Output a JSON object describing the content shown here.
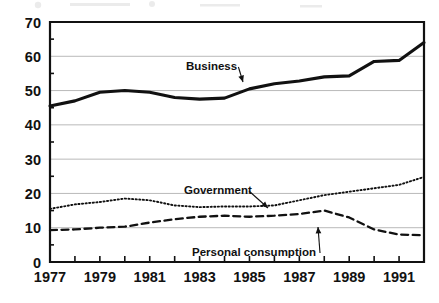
{
  "chart_data": {
    "type": "line",
    "title": "",
    "subtitle": "",
    "xlabel": "",
    "ylabel": "",
    "xlim": [
      1977,
      1992
    ],
    "ylim": [
      0,
      70
    ],
    "yticks": [
      0,
      10,
      20,
      30,
      40,
      50,
      60,
      70
    ],
    "ytick_labels": [
      "0",
      "10",
      "20",
      "30",
      "40",
      "50",
      "60",
      "70"
    ],
    "x": [
      1977,
      1978,
      1979,
      1980,
      1981,
      1982,
      1983,
      1984,
      1985,
      1986,
      1987,
      1988,
      1989,
      1990,
      1991,
      1992
    ],
    "xtick_labels": [
      "1977",
      "",
      "1979",
      "",
      "1981",
      "",
      "1983",
      "",
      "1985",
      "",
      "1987",
      "",
      "1989",
      "",
      "1991",
      ""
    ],
    "xticks_all": [
      1977,
      1978,
      1979,
      1980,
      1981,
      1982,
      1983,
      1984,
      1985,
      1986,
      1987,
      1988,
      1989,
      1990,
      1991,
      1992
    ],
    "grid": "horizontal",
    "legend": "inline-annotations",
    "series": [
      {
        "name": "Business",
        "style": "solid-thick",
        "color": "#111111",
        "values": [
          45.5,
          47.0,
          49.5,
          50.0,
          49.5,
          48.0,
          47.5,
          47.8,
          50.5,
          52.0,
          52.8,
          54.0,
          54.3,
          58.5,
          58.8,
          64.0
        ]
      },
      {
        "name": "Government",
        "style": "dotted",
        "color": "#111111",
        "values": [
          15.5,
          16.8,
          17.5,
          18.5,
          18.0,
          16.5,
          16.0,
          16.2,
          16.2,
          16.5,
          18.0,
          19.5,
          20.5,
          21.5,
          22.5,
          24.8
        ]
      },
      {
        "name": "Personal consumption",
        "style": "dashed",
        "color": "#111111",
        "values": [
          9.3,
          9.5,
          10.0,
          10.3,
          11.5,
          12.5,
          13.2,
          13.5,
          13.2,
          13.5,
          14.0,
          15.0,
          13.0,
          9.5,
          8.0,
          7.8
        ]
      }
    ],
    "annotations": [
      {
        "text": "Business",
        "x_px": 186,
        "y_px": 70,
        "arrow_to_x_px": 243,
        "arrow_to_y_px": 82
      },
      {
        "text": "Government",
        "x_px": 184,
        "y_px": 194,
        "arrow_to_x_px": 268,
        "arrow_to_y_px": 208
      },
      {
        "text": "Personal consumption",
        "x_px": 192,
        "y_px": 256,
        "arrow_to_x_px": 318,
        "arrow_to_y_px": 227
      }
    ]
  },
  "plot": {
    "left_px": 50,
    "right_px": 424,
    "top_px": 22,
    "bottom_px": 262
  }
}
